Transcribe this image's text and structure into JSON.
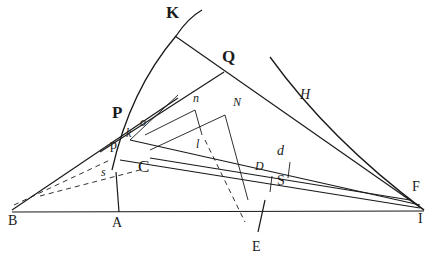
{
  "figure": {
    "type": "geometric construction diagram",
    "colors": {
      "ink": "#1a1a1a",
      "paper": "#ffffff"
    },
    "labels": {
      "K": "K",
      "Q": "Q",
      "P": "P",
      "H": "H",
      "n": "n",
      "N": "N",
      "o": "o",
      "k": "k",
      "p": "p",
      "C": "C",
      "s": "s",
      "l": "l",
      "d": "d",
      "D": "D",
      "S": "S",
      "F": "F",
      "I": "I",
      "B": "B",
      "A": "A",
      "E": "E"
    },
    "points": {
      "K": [
        178,
        40
      ],
      "Q": [
        215,
        70
      ],
      "P": [
        122,
        130
      ],
      "B": [
        12,
        210
      ],
      "A": [
        118,
        210
      ],
      "I": [
        422,
        210
      ],
      "F": [
        418,
        195
      ],
      "C": [
        140,
        155
      ],
      "E": [
        240,
        240
      ],
      "N": [
        230,
        112
      ],
      "n": [
        192,
        110
      ],
      "D": [
        270,
        168
      ],
      "S": [
        290,
        178
      ]
    }
  }
}
